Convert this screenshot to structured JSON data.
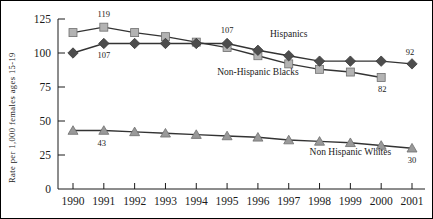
{
  "chart_data": {
    "type": "line",
    "title": "",
    "xlabel": "",
    "ylabel": "Rate per 1,000 females ages 15-19",
    "x": [
      1990,
      1991,
      1992,
      1993,
      1994,
      1995,
      1996,
      1997,
      1998,
      1999,
      2000,
      2001
    ],
    "xtick_labels": [
      "1990",
      "1991",
      "1992",
      "1993",
      "1994",
      "1995",
      "1996",
      "1997",
      "1998",
      "1999",
      "2000",
      "2001"
    ],
    "ytick_labels": [
      "0",
      "25",
      "50",
      "75",
      "100",
      "125"
    ],
    "yticks": [
      0,
      25,
      50,
      75,
      100,
      125
    ],
    "ylim": [
      0,
      125
    ],
    "grid": false,
    "legend_position": "inline-annotations",
    "series": [
      {
        "name": "Non-Hispanic Blacks",
        "marker": "square",
        "color": "#b3b3b3",
        "line_color": "#333333",
        "x": [
          1990,
          1991,
          1992,
          1993,
          1994,
          1995,
          1996,
          1997,
          1998,
          1999,
          2000
        ],
        "values": [
          115,
          119,
          115,
          112,
          108,
          104,
          98,
          92,
          88,
          86,
          82
        ]
      },
      {
        "name": "Hispanics",
        "marker": "diamond",
        "color": "#4d4d4d",
        "line_color": "#333333",
        "x": [
          1990,
          1991,
          1992,
          1993,
          1994,
          1995,
          1996,
          1997,
          1998,
          1999,
          2000,
          2001
        ],
        "values": [
          100,
          107,
          107,
          107,
          107,
          107,
          102,
          98,
          94,
          94,
          94,
          92
        ]
      },
      {
        "name": "Non Hispanic Whites",
        "marker": "triangle",
        "color": "#999999",
        "line_color": "#333333",
        "x": [
          1990,
          1991,
          1992,
          1993,
          1994,
          1995,
          1996,
          1997,
          1998,
          1999,
          2000,
          2001
        ],
        "values": [
          43,
          43,
          42,
          41,
          40,
          39,
          38,
          36,
          35,
          34,
          32,
          30
        ]
      }
    ],
    "annotations": [
      {
        "text": "Hispanics",
        "x": 1997,
        "y": 112,
        "name": "hispanics-series-label"
      },
      {
        "text": "Non-Hispanic  Blacks",
        "x": 1996,
        "y": 84,
        "name": "non-hispanic-blacks-series-label"
      },
      {
        "text": "Non Hispanic  Whites",
        "x": 1999,
        "y": 25,
        "name": "non-hispanic-whites-series-label"
      }
    ],
    "point_labels": [
      {
        "text": "119",
        "x": 1991,
        "y": 119,
        "series": "Non-Hispanic Blacks",
        "name": "label-blacks-1991"
      },
      {
        "text": "107",
        "x": 1991,
        "y": 107,
        "series": "Hispanics",
        "name": "label-hispanics-1991"
      },
      {
        "text": "107",
        "x": 1995,
        "y": 107,
        "series": "Hispanics",
        "name": "label-hispanics-1995"
      },
      {
        "text": "92",
        "x": 2001,
        "y": 92,
        "series": "Hispanics",
        "name": "label-hispanics-2001"
      },
      {
        "text": "82",
        "x": 2000,
        "y": 82,
        "series": "Non-Hispanic Blacks",
        "name": "label-blacks-2000"
      },
      {
        "text": "43",
        "x": 1991,
        "y": 43,
        "series": "Non Hispanic Whites",
        "name": "label-whites-1990"
      },
      {
        "text": "30",
        "x": 2001,
        "y": 30,
        "series": "Non Hispanic Whites",
        "name": "label-whites-2001"
      }
    ]
  }
}
